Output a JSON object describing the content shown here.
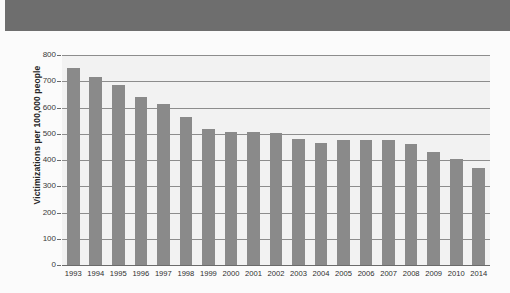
{
  "figure": {
    "background_color": "#fbfbfb",
    "band_color": "#6e6e6e",
    "plot_background_color": "#f2f2f2",
    "bar_color": "#8a8a8a",
    "gridline_color": "#8d8d8d"
  },
  "chart_data": {
    "type": "bar",
    "title": "",
    "subtitle": "",
    "xlabel": "",
    "ylabel": "Victimizations per 100,000 people",
    "categories": [
      "1993",
      "1994",
      "1995",
      "1996",
      "1997",
      "1998",
      "1999",
      "2000",
      "2001",
      "2002",
      "2003",
      "2004",
      "2005",
      "2006",
      "2007",
      "2008",
      "2009",
      "2010",
      "2014"
    ],
    "values": [
      750,
      715,
      685,
      640,
      612,
      565,
      520,
      505,
      505,
      502,
      480,
      465,
      475,
      478,
      475,
      460,
      430,
      405,
      370
    ],
    "ylim": [
      0,
      800
    ],
    "ytick_labels": [
      "0",
      "100",
      "200",
      "300",
      "400",
      "500",
      "600",
      "700",
      "800"
    ],
    "ytick_values": [
      0,
      100,
      200,
      300,
      400,
      500,
      600,
      700,
      800
    ],
    "grid": true,
    "grid_axis": "y",
    "legend": "none",
    "legend_position": "none",
    "annotations": []
  }
}
